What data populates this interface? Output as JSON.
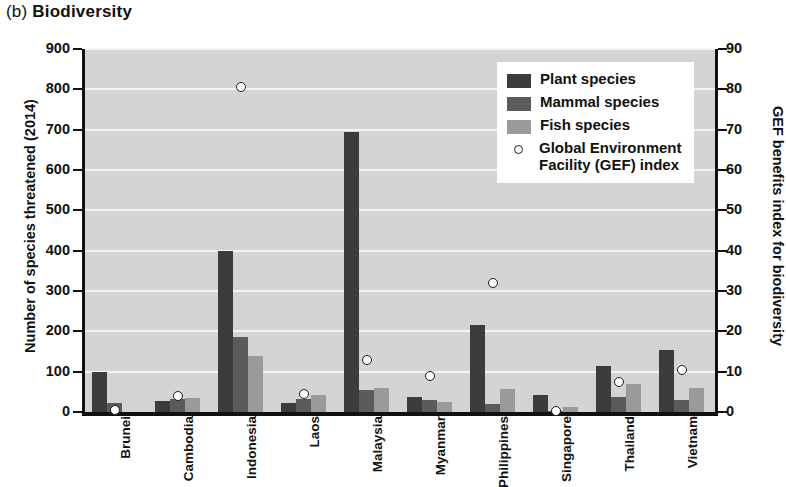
{
  "title": {
    "tag": "(b)",
    "text": "Biodiversity"
  },
  "legend": {
    "items": [
      {
        "key": "plant",
        "label": "Plant species",
        "swatch": "dark-square-swatch",
        "color": "#3c3c3c"
      },
      {
        "key": "mammal",
        "label": "Mammal species",
        "swatch": "medium-square-swatch",
        "color": "#5b5b5b"
      },
      {
        "key": "fish",
        "label": "Fish species",
        "swatch": "light-square-swatch",
        "color": "#9a9a9a"
      },
      {
        "key": "gef",
        "label": "Global Environment\nFacility (GEF) index",
        "swatch": "open-circle-marker",
        "color": "#ffffff"
      }
    ]
  },
  "chart_data": {
    "type": "bar",
    "title": "(b) Biodiversity",
    "xlabel": "",
    "ylabel": "Number of species threatened (2014)",
    "y2label": "GEF benefits index for biodiversity",
    "ylim": [
      0,
      900
    ],
    "y2lim": [
      0,
      90
    ],
    "yticks": [
      0,
      100,
      200,
      300,
      400,
      500,
      600,
      700,
      800,
      900
    ],
    "y2ticks": [
      0,
      10,
      20,
      30,
      40,
      50,
      60,
      70,
      80,
      90
    ],
    "grid": true,
    "legend_position": "upper right",
    "categories": [
      "Brunei",
      "Cambodia",
      "Indonesia",
      "Laos",
      "Malaysia",
      "Myanmar",
      "Philippines",
      "Singapore",
      "Thailand",
      "Vietnam"
    ],
    "series": [
      {
        "name": "Plant species",
        "axis": "left",
        "type": "bar",
        "color": "#3c3c3c",
        "values": [
          100,
          28,
          400,
          22,
          695,
          38,
          215,
          42,
          115,
          153
        ]
      },
      {
        "name": "Mammal species",
        "axis": "left",
        "type": "bar",
        "color": "#5b5b5b",
        "values": [
          22,
          33,
          185,
          32,
          55,
          30,
          20,
          2,
          37,
          30
        ]
      },
      {
        "name": "Fish species",
        "axis": "left",
        "type": "bar",
        "color": "#9a9a9a",
        "values": [
          0,
          35,
          140,
          42,
          60,
          25,
          58,
          12,
          70,
          60
        ]
      },
      {
        "name": "Global Environment Facility (GEF) index",
        "axis": "right",
        "type": "scatter",
        "marker": "open-circle",
        "color": "#ffffff",
        "values": [
          0.5,
          4,
          80.5,
          4.5,
          13,
          9,
          32,
          0.2,
          7.5,
          10.5
        ]
      }
    ]
  }
}
